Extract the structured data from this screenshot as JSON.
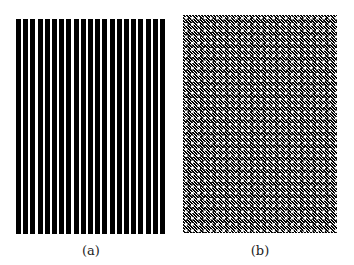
{
  "figure": {
    "panels": [
      {
        "id": "a",
        "caption": "(a)",
        "pattern": "vertical-stripes",
        "stripe_count": 21,
        "colors": {
          "stripe": "#000000",
          "gap": "#ffffff"
        }
      },
      {
        "id": "b",
        "caption": "(b)",
        "pattern": "dense-checkerboard-texture",
        "colors": {
          "base": "#777777",
          "dark": "#000000",
          "light": "#ffffff"
        }
      }
    ]
  }
}
